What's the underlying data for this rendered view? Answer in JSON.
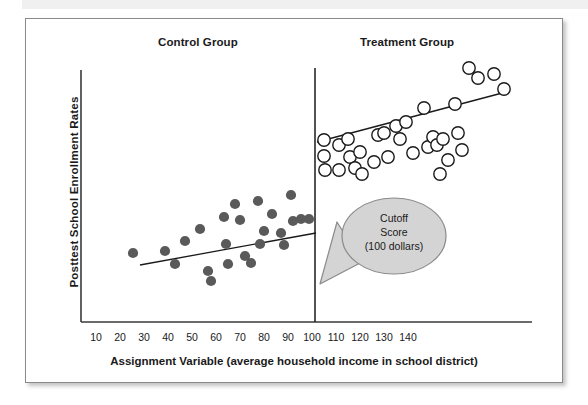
{
  "figure": {
    "x_axis_label": "Assignment Variable (average household income in school district)",
    "y_axis_label": "Posttest  School Enrollment Rates",
    "control_title": "Control Group",
    "treatment_title": "Treatment Group",
    "callout": {
      "line1": "Cutoff",
      "line2": "Score",
      "line3": "(100 dollars)"
    },
    "colors": {
      "control_marker_fill": "#5a5a5a",
      "treatment_marker_fill": "#ffffff",
      "treatment_marker_stroke": "#1a1a1a",
      "axis": "#3a3a3a",
      "cutoff_line": "#1a1a1a",
      "trend_line": "#1a1a1a",
      "callout_fill": "#d4d4d4",
      "callout_stroke": "#8a8a8a",
      "frame_border": "#8a8a8a",
      "text": "#1a1a1a"
    }
  },
  "chart_data": {
    "type": "scatter",
    "title": "",
    "xlabel": "Assignment Variable (average household income in school district)",
    "ylabel": "Posttest  School Enrollment Rates",
    "xlim": [
      5,
      150
    ],
    "ylim": [
      0,
      100
    ],
    "grid": false,
    "legend": "none",
    "xticks": [
      10,
      20,
      30,
      40,
      50,
      60,
      70,
      80,
      90,
      100,
      110,
      120,
      130,
      140
    ],
    "ytick_labels": [],
    "annotations": [
      {
        "name": "cutoff-callout",
        "text": "Cutoff Score (100 dollars)",
        "points_to_x": 100
      },
      {
        "name": "control-group-title",
        "text": "Control Group"
      },
      {
        "name": "treatment-group-title",
        "text": "Treatment Group"
      }
    ],
    "cutoff": {
      "x": 99,
      "label": "Cutoff Score (100 dollars)"
    },
    "series": [
      {
        "name": "Control Group",
        "marker": "filled-circle",
        "color": "#5a5a5a",
        "points": [
          [
            25,
            27
          ],
          [
            38,
            28
          ],
          [
            42,
            22
          ],
          [
            46,
            32
          ],
          [
            52,
            37
          ],
          [
            56,
            19
          ],
          [
            57,
            14
          ],
          [
            62,
            42
          ],
          [
            62,
            30
          ],
          [
            63,
            22
          ],
          [
            66,
            49
          ],
          [
            68,
            41
          ],
          [
            70,
            26
          ],
          [
            72,
            22
          ],
          [
            75,
            51
          ],
          [
            76,
            30
          ],
          [
            77,
            37
          ],
          [
            80,
            44
          ],
          [
            84,
            36
          ],
          [
            85,
            29
          ],
          [
            88,
            55
          ],
          [
            89,
            41
          ],
          [
            91,
            43
          ],
          [
            93,
            43
          ]
        ]
      },
      {
        "name": "Treatment Group",
        "marker": "open-circle",
        "color": "#ffffff",
        "points": [
          [
            100,
            71
          ],
          [
            100,
            65
          ],
          [
            100,
            60
          ],
          [
            104,
            69
          ],
          [
            104,
            60
          ],
          [
            106,
            70
          ],
          [
            107,
            65
          ],
          [
            110,
            61
          ],
          [
            111,
            67
          ],
          [
            112,
            58
          ],
          [
            114,
            63
          ],
          [
            116,
            73
          ],
          [
            117,
            74
          ],
          [
            118,
            64
          ],
          [
            120,
            77
          ],
          [
            122,
            70
          ],
          [
            123,
            76
          ],
          [
            126,
            72
          ],
          [
            128,
            86
          ],
          [
            129,
            82
          ],
          [
            130,
            70
          ],
          [
            131,
            60
          ],
          [
            133,
            71
          ],
          [
            134,
            71
          ],
          [
            135,
            65
          ],
          [
            137,
            90
          ],
          [
            137,
            73
          ],
          [
            139,
            67
          ],
          [
            141,
            84
          ],
          [
            143,
            87
          ],
          [
            146,
            86
          ],
          [
            148,
            80
          ]
        ]
      }
    ],
    "trend_lines": [
      {
        "name": "control-trend-line",
        "x0": 25,
        "y0": 20,
        "x1": 97,
        "y1": 42
      },
      {
        "name": "treatment-trend-line",
        "x0": 100,
        "y0": 58,
        "x1": 146,
        "y1": 78
      }
    ]
  }
}
